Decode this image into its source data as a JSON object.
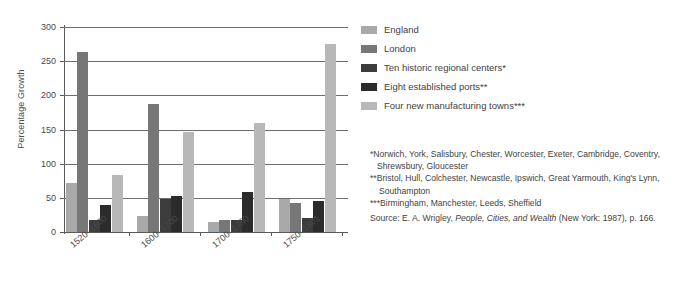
{
  "chart_data": {
    "type": "bar",
    "title": "",
    "xlabel": "",
    "ylabel": "Percentage Growth",
    "ylim": [
      0,
      300
    ],
    "yticks": [
      0,
      50,
      100,
      150,
      200,
      250,
      300
    ],
    "grid": true,
    "legend_position": "right",
    "categories": [
      "1520–1600",
      "1600–1700",
      "1700–1750",
      "1750–1801"
    ],
    "series": [
      {
        "name": "England",
        "color": "#a9a9a9",
        "values": [
          71,
          23,
          14,
          48
        ]
      },
      {
        "name": "London",
        "color": "#777777",
        "values": [
          263,
          188,
          17,
          42
        ]
      },
      {
        "name": "Ten historic regional centers*",
        "color": "#3c3c3c",
        "values": [
          18,
          48,
          18,
          21
        ]
      },
      {
        "name": "Eight established ports**",
        "color": "#2b2b2b",
        "values": [
          39,
          53,
          58,
          46
        ]
      },
      {
        "name": "Four new manufacturing towns***",
        "color": "#b8b8b8",
        "values": [
          84,
          147,
          159,
          275
        ]
      }
    ]
  },
  "axis": {
    "y_title": "Percentage Growth",
    "y_tick_labels": [
      "0",
      "50",
      "100",
      "150",
      "200",
      "250",
      "300"
    ],
    "x_tick_labels": [
      "1520–1600",
      "1600–1700",
      "1700–1750",
      "1750–1801"
    ]
  },
  "legend": {
    "items": [
      {
        "label": "England",
        "color": "#a9a9a9"
      },
      {
        "label": "London",
        "color": "#777777"
      },
      {
        "label": "Ten historic regional centers*",
        "color": "#3c3c3c"
      },
      {
        "label": "Eight established ports**",
        "color": "#2b2b2b"
      },
      {
        "label": "Four new manufacturing towns***",
        "color": "#b8b8b8"
      }
    ]
  },
  "notes": {
    "footnote_1_line_1": "*Norwich, York, Salisbury, Chester, Worcester, Exeter, Cambridge,",
    "footnote_1_line_2": "Coventry, Shrewsbury, Gloucester",
    "footnote_2_line_1": "**Bristol, Hull, Colchester, Newcastle, Ipswich, Great Yarmouth, King's",
    "footnote_2_line_2": "Lynn, Southampton",
    "footnote_3": "***Birmingham, Manchester, Leeds, Sheffield",
    "source_prefix": "Source: E. A. Wrigley, ",
    "source_title": "People, Cities, and Wealth",
    "source_suffix": " (New York: 1987), p. 166."
  },
  "colors": {
    "axis": "#5a5a5a",
    "grid": "#6e6e6e",
    "text": "#3f3f3f",
    "background": "#ffffff"
  }
}
